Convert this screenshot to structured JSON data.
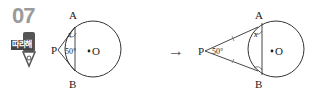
{
  "problem": {
    "number": "07",
    "badge_label": "따라해"
  },
  "figure_left": {
    "point_p": "P",
    "point_a": "A",
    "point_b": "B",
    "center": "O",
    "angle_p": "50°",
    "angle_x": "x"
  },
  "arrow": "→",
  "figure_right": {
    "point_p": "P",
    "point_a": "A",
    "point_b": "B",
    "center": "O",
    "angle_p": "50°",
    "angle_x": "x"
  }
}
